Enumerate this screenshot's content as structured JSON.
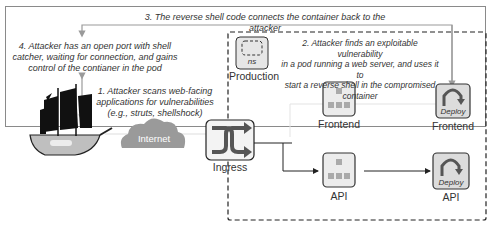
{
  "diagram": {
    "annotations": {
      "step3": "3. The reverse shell code connects the container back to the attacker",
      "step4_line1": "4. Attacker has an open port with shell",
      "step4_line2": "catcher, waiting for connection, and gains",
      "step4_line3": "control of the contianer in the pod",
      "step1_line1": "1. Attacker scans web-facing",
      "step1_line2": "applications for vulnerabilities",
      "step1_line3": "(e.g., struts, shellshock)",
      "step2_line1": "2. Attacker finds an exploitable vulnerability",
      "step2_line2": "in a pod running a web server, and uses it to",
      "step2_line3": "start a reverse shell in the compromised",
      "step2_line4": "container"
    },
    "nodes": {
      "namespace_badge": "ns",
      "namespace_label": "Production",
      "internet_label": "Internet",
      "ingress_label": "Ingress",
      "frontend_service_label": "Frontend",
      "frontend_deploy_badge": "Deploy",
      "frontend_deploy_label": "Frontend",
      "api_service_label": "API",
      "api_deploy_badge": "Deploy",
      "api_deploy_label": "API"
    },
    "colors": {
      "border": "#8a8a8a",
      "dashed": "#222222",
      "icon_fill": "#e6e6e6",
      "icon_stroke": "#333333",
      "cloud": "#9a9a9a",
      "arrow_gray": "#9a9a9a"
    }
  }
}
